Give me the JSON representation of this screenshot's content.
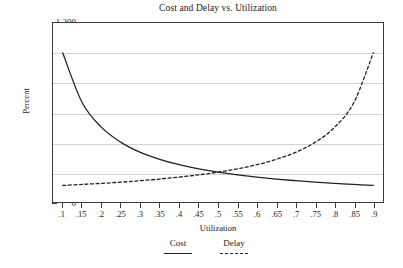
{
  "chart_data": {
    "type": "line",
    "title": "Cost and Delay vs. Utilization",
    "xlabel": "Utilization",
    "ylabel": "Percent",
    "xlim": [
      0.075,
      0.925
    ],
    "ylim": [
      0,
      1200
    ],
    "grid": true,
    "legend_position": "bottom",
    "x_ticks": [
      ".1",
      ".15",
      ".2",
      ".25",
      ".3",
      ".35",
      ".4",
      ".45",
      ".5",
      ".55",
      ".6",
      ".65",
      ".7",
      ".75",
      ".8",
      ".85",
      ".9"
    ],
    "x_tick_values": [
      0.1,
      0.15,
      0.2,
      0.25,
      0.3,
      0.35,
      0.4,
      0.45,
      0.5,
      0.55,
      0.6,
      0.65,
      0.7,
      0.75,
      0.8,
      0.85,
      0.9
    ],
    "y_ticks": [
      "0",
      "200",
      "400",
      "600",
      "800",
      "1,000",
      "1,200"
    ],
    "y_tick_values": [
      0,
      200,
      400,
      600,
      800,
      1000,
      1200
    ],
    "y_minor_tick_values": [
      100,
      300,
      500,
      700,
      900,
      1100
    ],
    "x": [
      0.1,
      0.15,
      0.2,
      0.25,
      0.3,
      0.35,
      0.4,
      0.45,
      0.5,
      0.55,
      0.6,
      0.65,
      0.7,
      0.75,
      0.8,
      0.85,
      0.9
    ],
    "series": [
      {
        "name": "Cost",
        "style": "solid",
        "color": "#222222",
        "values": [
          1000,
          667,
          500,
          400,
          333,
          286,
          250,
          222,
          200,
          182,
          167,
          154,
          143,
          133,
          125,
          118,
          111
        ]
      },
      {
        "name": "Delay",
        "style": "dashed",
        "color": "#222222",
        "values": [
          111,
          118,
          125,
          133,
          143,
          154,
          167,
          182,
          200,
          222,
          250,
          286,
          333,
          400,
          500,
          667,
          1000
        ]
      }
    ]
  },
  "legend": {
    "entries": [
      {
        "label": "Cost",
        "style": "solid"
      },
      {
        "label": "Delay",
        "style": "dashed"
      }
    ]
  }
}
